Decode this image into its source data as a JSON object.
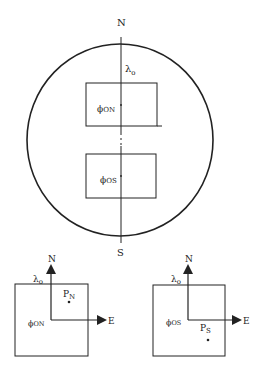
{
  "main": {
    "north_label": "N",
    "south_label": "S",
    "lambda_label": "λ",
    "lambda_sub": "o",
    "phi_north": "ϕ",
    "phi_north_sub": "ON",
    "phi_south": "ϕ",
    "phi_south_sub": "OS"
  },
  "left_inset": {
    "north_label": "N",
    "east_label": "E",
    "lambda_label": "λ",
    "lambda_sub": "o",
    "phi_label": "ϕ",
    "phi_sub": "ON",
    "point_label": "P",
    "point_sub": "N"
  },
  "right_inset": {
    "north_label": "N",
    "east_label": "E",
    "lambda_label": "λ",
    "lambda_sub": "o",
    "phi_label": "ϕ",
    "phi_sub": "OS",
    "point_label": "P",
    "point_sub": "S"
  },
  "colors": {
    "ink": "#222222",
    "background": "#ffffff"
  }
}
